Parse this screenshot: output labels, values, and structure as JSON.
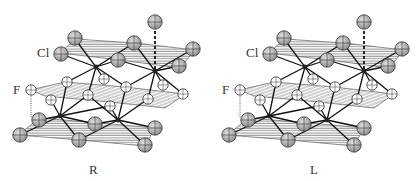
{
  "figure": {
    "panels": [
      {
        "id": "R",
        "caption": "R",
        "atom_labels": {
          "upper": "Cl",
          "middle": "F"
        }
      },
      {
        "id": "L",
        "caption": "L",
        "atom_labels": {
          "upper": "Cl",
          "middle": "F"
        }
      }
    ],
    "legend_atoms": {
      "Cl": {
        "fill": "#b8b8b8",
        "description": "gray sphere with cross"
      },
      "F": {
        "fill": "#ffffff",
        "description": "white sphere with cross"
      },
      "metal": {
        "fill": "#222222",
        "description": "small dark node"
      }
    },
    "colors": {
      "hatch": "#555555",
      "bond": "#111111",
      "outline": "#333333"
    }
  }
}
